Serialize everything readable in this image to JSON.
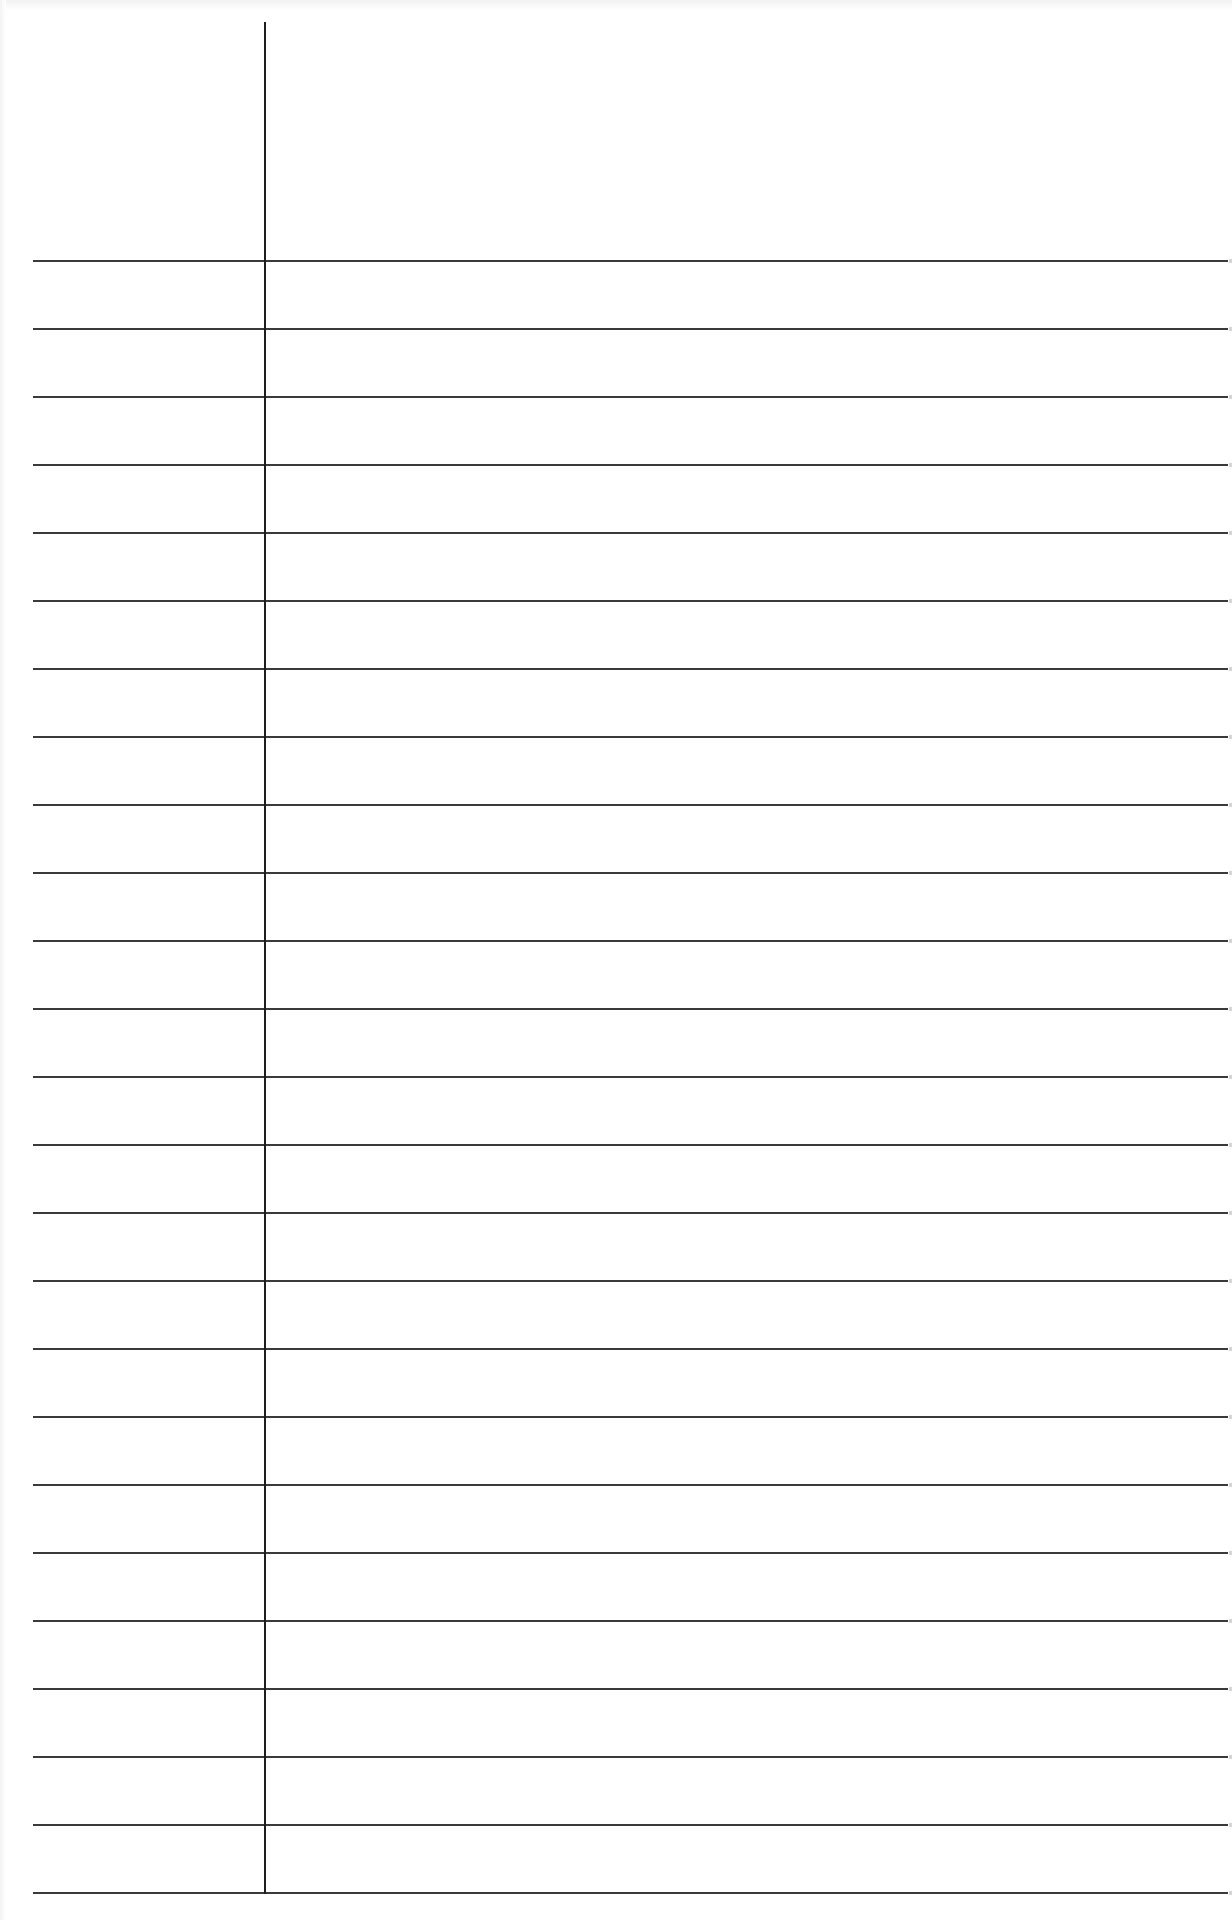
{
  "document": {
    "type": "lined-paper",
    "background_color": "#ffffff",
    "rule_color": "#3a3a3a",
    "margin_line_color": "#1e1e1e",
    "rules": {
      "count": 25,
      "first_y": 260,
      "spacing": 68,
      "left_x": 33,
      "right_x": 1228
    },
    "margin_line": {
      "x": 264,
      "top_y": 22,
      "bottom_y": 1894
    },
    "text_content": []
  }
}
